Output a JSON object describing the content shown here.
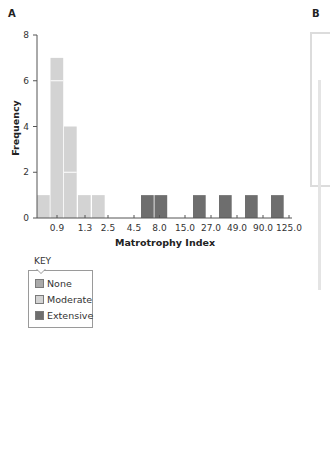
{
  "panels": {
    "a_label": "A",
    "b_label": "B"
  },
  "legend": {
    "title": "KEY",
    "items": [
      {
        "label": "None",
        "color": "#a9a9a9"
      },
      {
        "label": "Moderate",
        "color": "#d3d3d3"
      },
      {
        "label": "Extensive",
        "color": "#6e6e6e"
      }
    ]
  },
  "colors": {
    "none": "#a9a9a9",
    "moderate": "#d3d3d3",
    "extensive": "#6e6e6e",
    "axis": "#555555"
  },
  "chart_data": {
    "type": "bar",
    "title": "",
    "xlabel": "Matrotrophy Index",
    "ylabel": "Frequency",
    "ylim": [
      0,
      8
    ],
    "yticks": [
      0,
      2,
      4,
      6,
      8
    ],
    "xtick_labels": [
      "0.9",
      "1.3",
      "2.5",
      "4.5",
      "8.0",
      "15.0",
      "27.0",
      "49.0",
      "90.0",
      "125.0"
    ],
    "grid": false,
    "legend_position": "below-left",
    "bins": [
      {
        "bin": "<0.9 (a)",
        "value": 1,
        "category": "Moderate"
      },
      {
        "bin": "~0.9 (b)",
        "value": 7,
        "category": "Moderate",
        "stack_divisions": [
          6
        ]
      },
      {
        "bin": "0.9-1.3",
        "value": 4,
        "category": "Moderate",
        "stack_divisions": [
          2
        ]
      },
      {
        "bin": "1.3-2.5 (a)",
        "value": 1,
        "category": "Moderate"
      },
      {
        "bin": "1.3-2.5 (b)",
        "value": 1,
        "category": "Moderate"
      },
      {
        "bin": "4.5-8.0 (a)",
        "value": 1,
        "category": "Extensive"
      },
      {
        "bin": "4.5-8.0 (b)",
        "value": 1,
        "category": "Extensive"
      },
      {
        "bin": "15.0-27.0",
        "value": 1,
        "category": "Extensive"
      },
      {
        "bin": "27.0-49.0",
        "value": 1,
        "category": "Extensive"
      },
      {
        "bin": "49.0-90.0",
        "value": 1,
        "category": "Extensive"
      },
      {
        "bin": "90.0-125.0",
        "value": 1,
        "category": "Extensive"
      }
    ],
    "series": [
      {
        "name": "None",
        "values": [
          0,
          0,
          0,
          0,
          0,
          0,
          0,
          0,
          0,
          0,
          0
        ]
      },
      {
        "name": "Moderate",
        "values": [
          1,
          7,
          4,
          1,
          1,
          0,
          0,
          0,
          0,
          0,
          0
        ]
      },
      {
        "name": "Extensive",
        "values": [
          0,
          0,
          0,
          0,
          0,
          1,
          1,
          1,
          1,
          1,
          1
        ]
      }
    ]
  }
}
